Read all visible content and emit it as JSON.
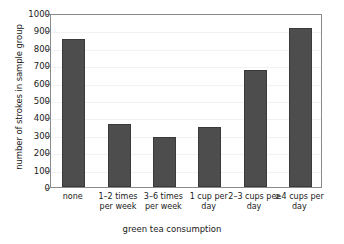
{
  "chart_data": {
    "type": "bar",
    "title": "",
    "xlabel": "green tea consumption",
    "ylabel": "number of strokes in sample group",
    "categories": [
      "none",
      "1–2 times\nper week",
      "3–6 times\nper week",
      "1 cup per\nday",
      "2–3 cups per\nday",
      "≥4 cups per\nday"
    ],
    "values": [
      850,
      365,
      290,
      345,
      675,
      915
    ],
    "ylim": [
      0,
      1000
    ],
    "ytick_step": 100,
    "yticks": [
      0,
      100,
      200,
      300,
      400,
      500,
      600,
      700,
      800,
      900,
      1000
    ],
    "grid": true,
    "legend": "none",
    "bar_color": "#4d4d4d",
    "bar_edge_color": "#3a3a3a",
    "frame_color": "#8a8a8a",
    "gridline_color": "#f2f2f2",
    "background": "#ffffff"
  }
}
